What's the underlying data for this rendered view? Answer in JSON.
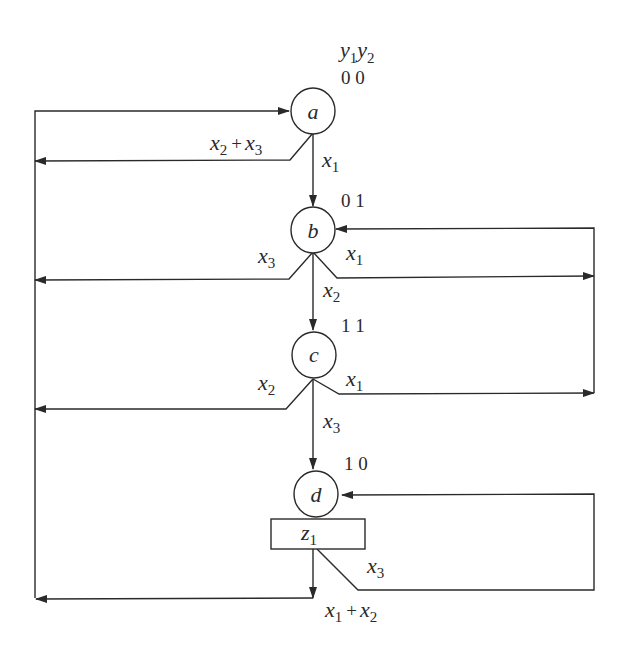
{
  "diagram": {
    "type": "state-transition-graph",
    "header": {
      "y1": "y",
      "y1_sub": "1",
      "y2": "y",
      "y2_sub": "2"
    },
    "states": [
      {
        "id": "a",
        "label": "a",
        "code": "0 0"
      },
      {
        "id": "b",
        "label": "b",
        "code": "0 1"
      },
      {
        "id": "c",
        "label": "c",
        "code": "1 1"
      },
      {
        "id": "d",
        "label": "d",
        "code": "1 0",
        "output": {
          "var": "z",
          "sub": "1"
        }
      }
    ],
    "transitions": [
      {
        "from": "a",
        "to": "b",
        "condition": "x1",
        "parts": [
          {
            "v": "x",
            "s": "1"
          }
        ]
      },
      {
        "from": "a",
        "to": "a",
        "condition": "x2 + x3",
        "parts": [
          {
            "v": "x",
            "s": "2"
          },
          {
            "v": "x",
            "s": "3"
          }
        ]
      },
      {
        "from": "b",
        "to": "c",
        "condition": "x2",
        "parts": [
          {
            "v": "x",
            "s": "2"
          }
        ]
      },
      {
        "from": "b",
        "to": "a",
        "condition": "x3",
        "parts": [
          {
            "v": "x",
            "s": "3"
          }
        ]
      },
      {
        "from": "b",
        "to": "b",
        "condition": "x1",
        "parts": [
          {
            "v": "x",
            "s": "1"
          }
        ]
      },
      {
        "from": "c",
        "to": "d",
        "condition": "x3",
        "parts": [
          {
            "v": "x",
            "s": "3"
          }
        ]
      },
      {
        "from": "c",
        "to": "a",
        "condition": "x2",
        "parts": [
          {
            "v": "x",
            "s": "2"
          }
        ]
      },
      {
        "from": "c",
        "to": "b",
        "condition": "x1",
        "parts": [
          {
            "v": "x",
            "s": "1"
          }
        ]
      },
      {
        "from": "d",
        "to": "d",
        "condition": "x3",
        "parts": [
          {
            "v": "x",
            "s": "3"
          }
        ]
      },
      {
        "from": "d",
        "to": "a",
        "condition": "x1 + x2",
        "parts": [
          {
            "v": "x",
            "s": "1"
          },
          {
            "v": "x",
            "s": "2"
          }
        ]
      }
    ],
    "plus": "+"
  }
}
